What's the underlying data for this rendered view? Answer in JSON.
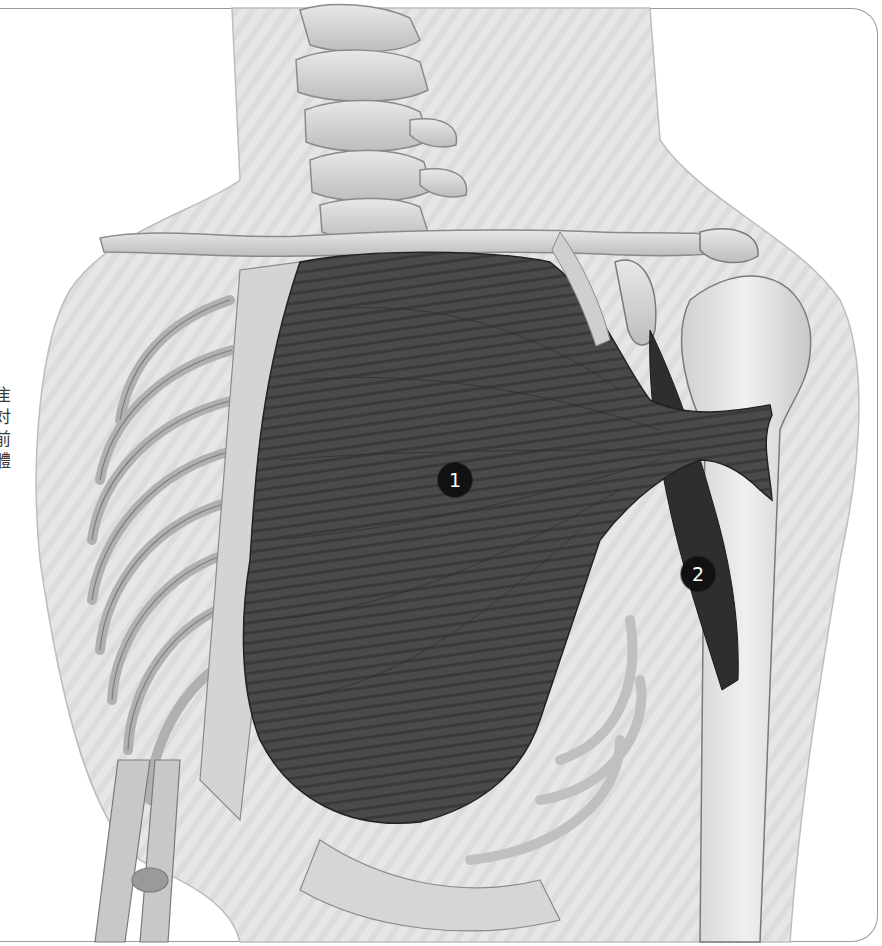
{
  "figure": {
    "labels": [
      {
        "number": "1",
        "target": "pectoralis-major",
        "x": 455,
        "y": 480
      },
      {
        "number": "2",
        "target": "coracobrachialis",
        "x": 698,
        "y": 574
      }
    ]
  },
  "side_text": {
    "punctuation": ";",
    "chars": [
      "隹",
      "対",
      "前",
      "體"
    ]
  },
  "colors": {
    "frame_border": "#9a9a9a",
    "body_silhouette": "#e4e4e4",
    "bone": "#cfcfcf",
    "muscle": "#3c3c3c",
    "badge_bg": "#111111",
    "badge_text": "#ffffff"
  }
}
